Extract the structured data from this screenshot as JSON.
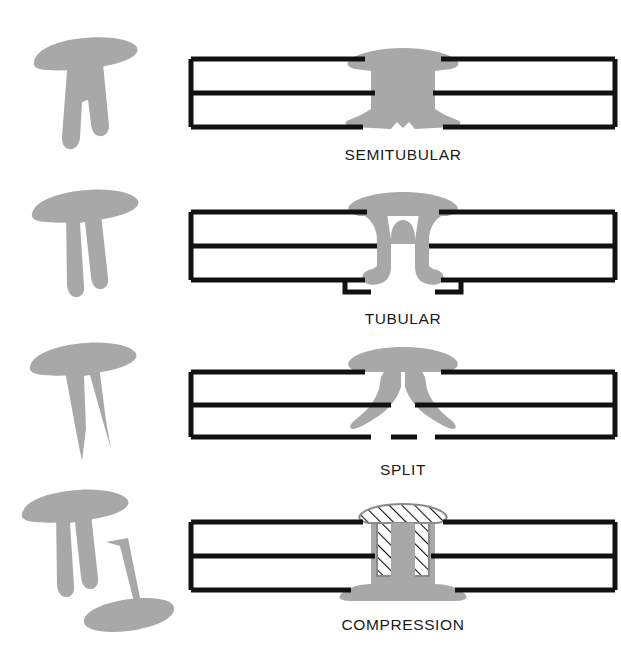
{
  "figure": {
    "background_color": "#ffffff",
    "line_color": "#111111",
    "rivet_fill": "#a8a8a8",
    "hatch_color": "#111111",
    "plate_count": 2
  },
  "rows": [
    {
      "id": "semitubular",
      "label": "SEMITUBULAR",
      "silhouette_name": "semitubular-rivet-silhouette",
      "section_name": "semitubular-rivet-section",
      "description": "Tilted T-shaped rivet with shallow notch in shank end",
      "pieces": 1,
      "hatched": false
    },
    {
      "id": "tubular",
      "label": "TUBULAR",
      "silhouette_name": "tubular-rivet-silhouette",
      "section_name": "tubular-rivet-section",
      "description": "Rivet with deep hollow bore splitting shank into two legs, clinched outward",
      "pieces": 1,
      "hatched": false
    },
    {
      "id": "split",
      "label": "SPLIT",
      "silhouette_name": "split-rivet-silhouette",
      "section_name": "split-rivet-section",
      "description": "Bifurcated rivet with two pointed prongs that splay outward",
      "pieces": 1,
      "hatched": false
    },
    {
      "id": "compression",
      "label": "COMPRESSION",
      "silhouette_name": "compression-rivet-silhouette",
      "section_name": "compression-rivet-section",
      "description": "Two-piece rivet: hatched male pin pressed into solid female sleeve",
      "pieces": 2,
      "hatched": true
    }
  ]
}
